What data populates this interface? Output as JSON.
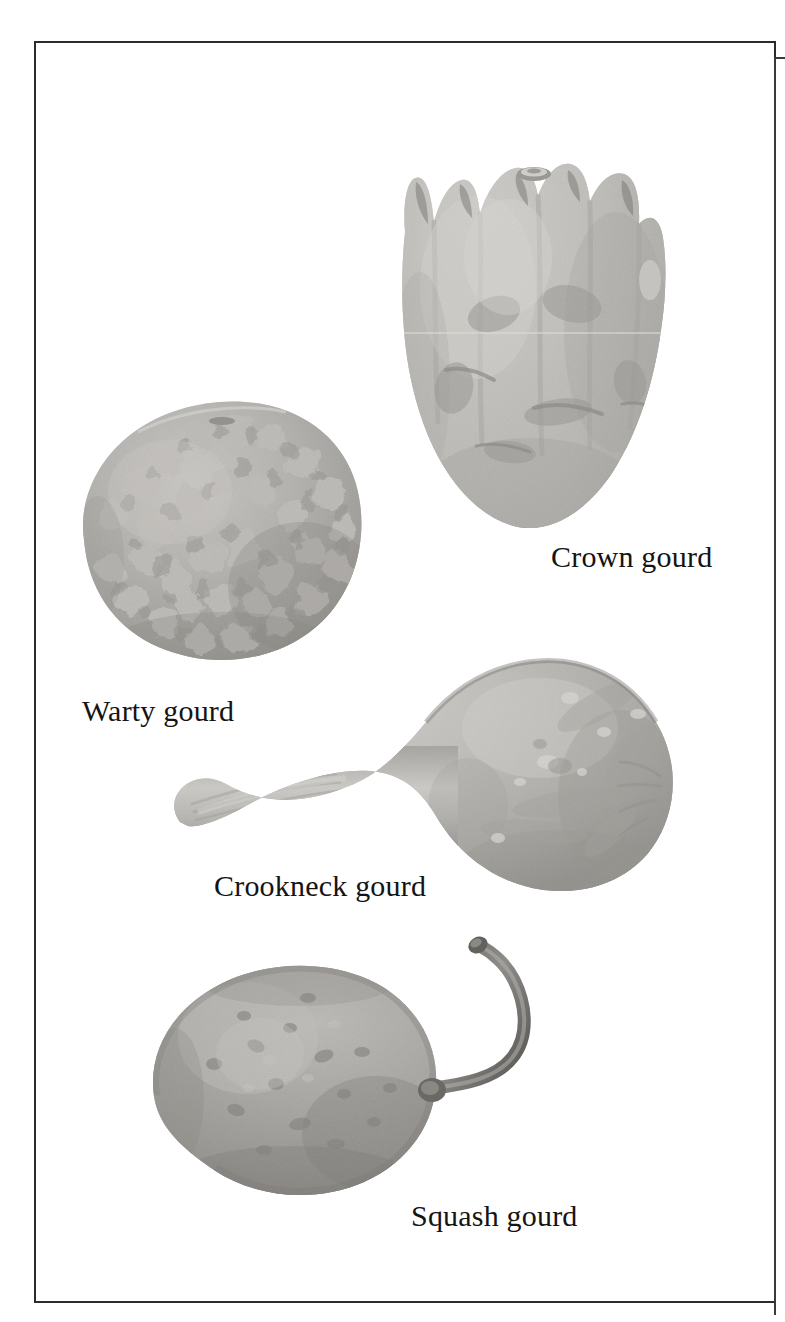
{
  "plate": {
    "title": "Gourd varieties illustration plate",
    "background_color": "#ffffff",
    "frame_color": "#2b2b2b",
    "caption_color": "#141414"
  },
  "figures": [
    {
      "id": "crown-gourd",
      "label": "Crown gourd",
      "description": "Upright bell-shaped gourd with a ring of pointed crown-like lobes around the top and a rounded base",
      "tone_light": "#d8d6d2",
      "tone_mid": "#a9a7a3",
      "tone_dark": "#6d6b68"
    },
    {
      "id": "warty-gourd",
      "label": "Warty gourd",
      "description": "Squat rounded gourd entirely covered in dense knobbly warts",
      "tone_light": "#cfcdc9",
      "tone_mid": "#9c9a96",
      "tone_dark": "#5e5c59"
    },
    {
      "id": "crookneck-gourd",
      "label": "Crookneck gourd",
      "description": "Bulbous body on the right with a long tapering neck curving down to the left",
      "tone_light": "#cdcbc6",
      "tone_mid": "#9d9b96",
      "tone_dark": "#6a6865"
    },
    {
      "id": "squash-gourd",
      "label": "Squash gourd",
      "description": "Round flattened gourd with a long S-curved stem rising to the upper right",
      "tone_light": "#c4c2bd",
      "tone_mid": "#8f8d89",
      "tone_dark": "#55534f"
    }
  ]
}
